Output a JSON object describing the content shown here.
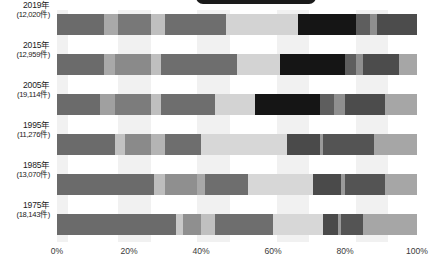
{
  "chart_data": {
    "type": "bar",
    "orientation": "horizontal",
    "stacked": true,
    "normalized": "100%",
    "title": "",
    "xlabel": "",
    "ylabel": "",
    "xlim": [
      0,
      100
    ],
    "grid": false,
    "legend_position": "none",
    "xticks": [
      "0%",
      "20%",
      "40%",
      "60%",
      "80%",
      "100%"
    ],
    "xtick_values": [
      0,
      20,
      40,
      60,
      80,
      100
    ],
    "categories": [
      "2019年",
      "2015年",
      "2005年",
      "1995年",
      "1985年",
      "1975年"
    ],
    "category_sublabels": [
      "(12,020件)",
      "(12,959件)",
      "(19,114件)",
      "(11,276件)",
      "(13,070件)",
      "(18,143件)"
    ],
    "series": [
      {
        "name": "seg-1",
        "color": "#6e6e6e",
        "values": [
          13,
          13,
          12,
          16,
          27,
          33
        ]
      },
      {
        "name": "seg-2",
        "color": "#a8a8a8",
        "values": [
          4,
          3,
          4,
          3,
          3,
          2
        ]
      },
      {
        "name": "seg-3",
        "color": "#7c7c7c",
        "values": [
          9,
          10,
          10,
          10,
          11,
          9
        ]
      },
      {
        "name": "seg-4",
        "color": "#bdbdbd",
        "values": [
          4,
          3,
          3,
          3,
          3,
          3
        ]
      },
      {
        "name": "seg-5",
        "color": "#6e6e6e",
        "values": [
          17,
          21,
          17,
          9,
          9,
          16
        ]
      },
      {
        "name": "seg-6",
        "color": "#d2d2d2",
        "values": [
          20,
          16,
          20,
          27,
          22,
          19
        ]
      },
      {
        "name": "seg-7",
        "color": "#4a4a4a",
        "values": [
          6,
          5,
          5,
          11,
          8,
          4
        ]
      },
      {
        "name": "seg-8",
        "color": "#5a5a5a",
        "values": [
          11,
          11,
          12,
          12,
          10,
          5
        ]
      },
      {
        "name": "seg-9",
        "color": "#a6a6a6",
        "values": [
          16,
          18,
          17,
          9,
          7,
          9
        ]
      }
    ],
    "row_segments": [
      [
        {
          "v": 13,
          "c": "#6b6b6b"
        },
        {
          "v": 4,
          "c": "#a9a9a9"
        },
        {
          "v": 9,
          "c": "#787878"
        },
        {
          "v": 4,
          "c": "#bfbfbf"
        },
        {
          "v": 17,
          "c": "#6e6e6e"
        },
        {
          "v": 20,
          "c": "#d3d3d3"
        },
        {
          "v": 16,
          "c": "#151515"
        },
        {
          "v": 4,
          "c": "#5e5e5e"
        },
        {
          "v": 2,
          "c": "#8f8f8f"
        },
        {
          "v": 11,
          "c": "#4c4c4c"
        }
      ],
      [
        {
          "v": 13,
          "c": "#6b6b6b"
        },
        {
          "v": 3,
          "c": "#a9a9a9"
        },
        {
          "v": 10,
          "c": "#8a8a8a"
        },
        {
          "v": 3,
          "c": "#bfbfbf"
        },
        {
          "v": 21,
          "c": "#6e6e6e"
        },
        {
          "v": 12,
          "c": "#d3d3d3"
        },
        {
          "v": 18,
          "c": "#151515"
        },
        {
          "v": 3,
          "c": "#5e5e5e"
        },
        {
          "v": 2,
          "c": "#8f8f8f"
        },
        {
          "v": 10,
          "c": "#4c4c4c"
        },
        {
          "v": 5,
          "c": "#a6a6a6"
        }
      ],
      [
        {
          "v": 12,
          "c": "#6b6b6b"
        },
        {
          "v": 4,
          "c": "#a0a0a0"
        },
        {
          "v": 10,
          "c": "#7c7c7c"
        },
        {
          "v": 3,
          "c": "#bfbfbf"
        },
        {
          "v": 15,
          "c": "#6e6e6e"
        },
        {
          "v": 11,
          "c": "#d3d3d3"
        },
        {
          "v": 18,
          "c": "#151515"
        },
        {
          "v": 4,
          "c": "#5e5e5e"
        },
        {
          "v": 3,
          "c": "#8f8f8f"
        },
        {
          "v": 11,
          "c": "#4c4c4c"
        },
        {
          "v": 9,
          "c": "#a6a6a6"
        }
      ],
      [
        {
          "v": 16,
          "c": "#6b6b6b"
        },
        {
          "v": 3,
          "c": "#c2c2c2"
        },
        {
          "v": 7,
          "c": "#8a8a8a"
        },
        {
          "v": 4,
          "c": "#b4b4b4"
        },
        {
          "v": 10,
          "c": "#6e6e6e"
        },
        {
          "v": 24,
          "c": "#d7d7d7"
        },
        {
          "v": 9,
          "c": "#4a4a4a"
        },
        {
          "v": 1,
          "c": "#9a9a9a"
        },
        {
          "v": 14,
          "c": "#545454"
        },
        {
          "v": 12,
          "c": "#a6a6a6"
        }
      ],
      [
        {
          "v": 27,
          "c": "#6b6b6b"
        },
        {
          "v": 3,
          "c": "#bdbdbd"
        },
        {
          "v": 9,
          "c": "#8f8f8f"
        },
        {
          "v": 2,
          "c": "#a8a8a8"
        },
        {
          "v": 12,
          "c": "#6e6e6e"
        },
        {
          "v": 18,
          "c": "#d7d7d7"
        },
        {
          "v": 8,
          "c": "#4a4a4a"
        },
        {
          "v": 1,
          "c": "#9a9a9a"
        },
        {
          "v": 11,
          "c": "#545454"
        },
        {
          "v": 9,
          "c": "#a6a6a6"
        }
      ],
      [
        {
          "v": 33,
          "c": "#6b6b6b"
        },
        {
          "v": 2,
          "c": "#c8c8c8"
        },
        {
          "v": 5,
          "c": "#8f8f8f"
        },
        {
          "v": 4,
          "c": "#c0c0c0"
        },
        {
          "v": 16,
          "c": "#6e6e6e"
        },
        {
          "v": 14,
          "c": "#d7d7d7"
        },
        {
          "v": 4,
          "c": "#4a4a4a"
        },
        {
          "v": 1,
          "c": "#9a9a9a"
        },
        {
          "v": 6,
          "c": "#545454"
        },
        {
          "v": 15,
          "c": "#a6a6a6"
        }
      ]
    ],
    "background_bands": [
      {
        "start": 0,
        "end": 3,
        "shade": "#f1f1f1"
      },
      {
        "start": 17,
        "end": 26,
        "shade": "#f1f1f1"
      },
      {
        "start": 39,
        "end": 48,
        "shade": "#f1f1f1"
      },
      {
        "start": 61,
        "end": 70,
        "shade": "#f1f1f1"
      },
      {
        "start": 83,
        "end": 92,
        "shade": "#f1f1f1"
      }
    ]
  },
  "colors": {
    "background": "#ffffff",
    "text": "#1a1a1a",
    "axis_text": "#3a3a3a",
    "band": "#f1f1f1",
    "capsule": "#1b1b1b"
  }
}
